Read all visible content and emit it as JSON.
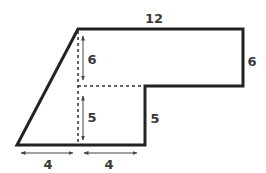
{
  "diagram": {
    "title": "",
    "colors": {
      "outline": "#222222",
      "dashed": "#333333",
      "arrow": "#444444",
      "label": "#3a3a3a"
    },
    "labels": {
      "top": "12",
      "right": "6",
      "inner_vertical": "5",
      "upper_height": "6",
      "lower_height": "5",
      "bottom_left": "4",
      "bottom_right": "4"
    }
  }
}
